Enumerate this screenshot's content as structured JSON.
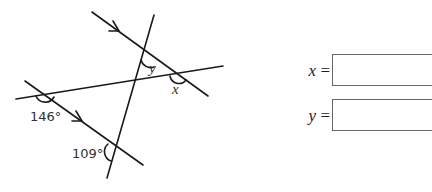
{
  "diagram": {
    "lines": [
      {
        "id": "parallel-top",
        "x1": 92,
        "y1": 12,
        "x2": 208,
        "y2": 96
      },
      {
        "id": "parallel-bottom",
        "x1": 25,
        "y1": 81,
        "x2": 143,
        "y2": 165
      },
      {
        "id": "transversal-steep",
        "x1": 154,
        "y1": 15,
        "x2": 107,
        "y2": 178
      },
      {
        "id": "transversal-shallow",
        "x1": 16,
        "y1": 99,
        "x2": 223,
        "y2": 66
      }
    ],
    "angle_labels": {
      "angle_146": "146°",
      "angle_109": "109°",
      "angle_x": "x",
      "angle_y": "y"
    },
    "parallel_marker": "arrow"
  },
  "answers": {
    "x": {
      "variable": "x",
      "equals": "=",
      "value": ""
    },
    "y": {
      "variable": "y",
      "equals": "=",
      "value": ""
    }
  }
}
